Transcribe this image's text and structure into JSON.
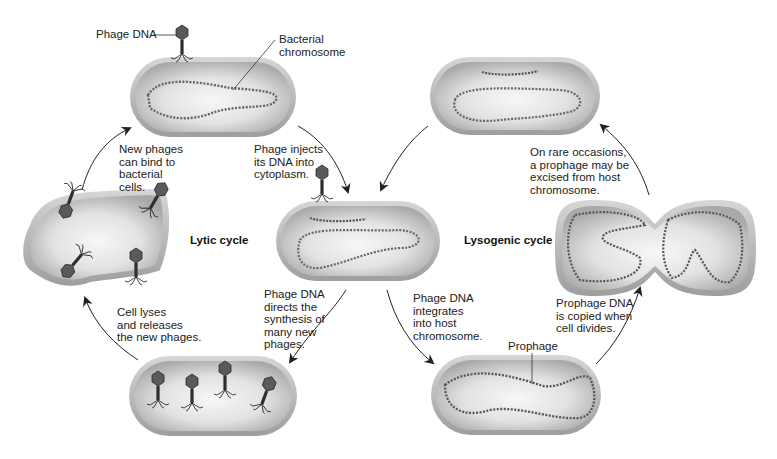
{
  "diagram": {
    "cycles": {
      "lytic": "Lytic cycle",
      "lysogenic": "Lysogenic cycle"
    },
    "labels": {
      "phage_dna": "Phage DNA",
      "bacterial_chromosome": "Bacterial\nchromosome",
      "prophage": "Prophage"
    },
    "steps": {
      "new_phages_bind": "New phages\ncan bind to\nbacterial\ncells.",
      "phage_injects": "Phage injects\nits DNA into\ncytoplasm.",
      "directs_synthesis": "Phage DNA\ndirects the\nsynthesis of\nmany new\nphages.",
      "cell_lyses": "Cell lyses\nand releases\nthe new phages.",
      "integrates": "Phage DNA\nintegrates\ninto host\nchromosome.",
      "copied_divides": "Prophage DNA\nis copied when\ncell divides.",
      "excised": "On rare occasions,\na prophage may be\nexcised from host\nchromosome."
    },
    "colors": {
      "cell_wall": "#b8b8b8",
      "cell_inner": "#d0d0d0",
      "cell_highlight": "#f4f4f4",
      "dna": "#555555",
      "phage": "#3a3a3a",
      "arrow": "#222222"
    }
  }
}
